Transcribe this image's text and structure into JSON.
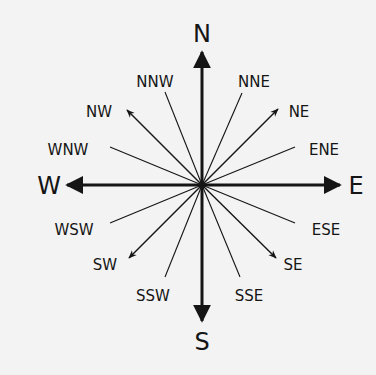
{
  "diagram": {
    "title": "",
    "type": "compass-rose",
    "colors": {
      "background": "#f3f3f3",
      "ink": "#151515"
    },
    "center": [
      202,
      185
    ],
    "labels": {
      "N": "N",
      "S": "S",
      "E": "E",
      "W": "W",
      "NE": "NE",
      "NW": "NW",
      "SE": "SE",
      "SW": "SW",
      "NNE": "NNE",
      "NNW": "NNW",
      "ENE": "ENE",
      "WNW": "WNW",
      "ESE": "ESE",
      "WSW": "WSW",
      "SSE": "SSE",
      "SSW": "SSW"
    },
    "points": [
      {
        "name": "N",
        "tier": "cardinal",
        "arrow": true
      },
      {
        "name": "NNE",
        "tier": "tertiary",
        "arrow": false
      },
      {
        "name": "NE",
        "tier": "intercardinal",
        "arrow": true
      },
      {
        "name": "ENE",
        "tier": "tertiary",
        "arrow": false
      },
      {
        "name": "E",
        "tier": "cardinal",
        "arrow": true
      },
      {
        "name": "ESE",
        "tier": "tertiary",
        "arrow": false
      },
      {
        "name": "SE",
        "tier": "intercardinal",
        "arrow": true
      },
      {
        "name": "SSE",
        "tier": "tertiary",
        "arrow": false
      },
      {
        "name": "S",
        "tier": "cardinal",
        "arrow": true
      },
      {
        "name": "SSW",
        "tier": "tertiary",
        "arrow": false
      },
      {
        "name": "SW",
        "tier": "intercardinal",
        "arrow": true
      },
      {
        "name": "WSW",
        "tier": "tertiary",
        "arrow": false
      },
      {
        "name": "W",
        "tier": "cardinal",
        "arrow": true
      },
      {
        "name": "WNW",
        "tier": "tertiary",
        "arrow": false
      },
      {
        "name": "NW",
        "tier": "intercardinal",
        "arrow": true
      },
      {
        "name": "NNW",
        "tier": "tertiary",
        "arrow": false
      }
    ]
  }
}
